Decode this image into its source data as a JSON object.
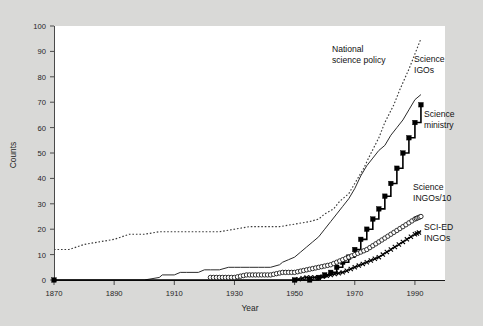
{
  "figure": {
    "background_color": "#d9d9d7",
    "plot_background_color": "#ffffff"
  },
  "axes": {
    "y_label": "Counts",
    "x_label": "Year",
    "y_ticks": [
      "0",
      "10",
      "20",
      "30",
      "40",
      "50",
      "60",
      "70",
      "80",
      "90",
      "100"
    ],
    "x_ticks": [
      "1870",
      "1890",
      "1910",
      "1930",
      "1950",
      "1970",
      "1990"
    ]
  },
  "annotations": {
    "national_science_policy": "National\nscience policy",
    "science_igos": "Science\nIGOs",
    "science_ministry": "Science\nministry",
    "science_ingos": "Science\nINGOs/10",
    "sci_ed_ingos": "SCI-ED\nINGOs"
  },
  "chart_data": {
    "type": "line",
    "title": "",
    "xlabel": "Year",
    "ylabel": "Counts",
    "xlim": [
      1870,
      2000
    ],
    "ylim": [
      0,
      100
    ],
    "xticks": [
      1870,
      1890,
      1910,
      1930,
      1950,
      1970,
      1990
    ],
    "yticks": [
      0,
      10,
      20,
      30,
      40,
      50,
      60,
      70,
      80,
      90,
      100
    ],
    "grid": false,
    "legend": "inline annotations",
    "series": [
      {
        "name": "National science policy",
        "style": "dotted",
        "marker": "none",
        "color": "#3a3a3a",
        "x": [
          1870,
          1875,
          1880,
          1885,
          1890,
          1895,
          1900,
          1905,
          1910,
          1915,
          1920,
          1925,
          1930,
          1935,
          1940,
          1945,
          1950,
          1955,
          1958,
          1960,
          1963,
          1965,
          1968,
          1970,
          1973,
          1975,
          1978,
          1980,
          1983,
          1985,
          1988,
          1990,
          1992
        ],
        "y": [
          12,
          12,
          14,
          15,
          16,
          18,
          18,
          19,
          19,
          19,
          19,
          19,
          20,
          21,
          21,
          21,
          22,
          23,
          24,
          26,
          28,
          31,
          34,
          38,
          44,
          49,
          56,
          62,
          69,
          75,
          83,
          89,
          95
        ]
      },
      {
        "name": "Science IGOs",
        "style": "solid-thin",
        "marker": "none",
        "color": "#2b2b2b",
        "x": [
          1870,
          1900,
          1905,
          1906,
          1910,
          1912,
          1914,
          1918,
          1920,
          1922,
          1925,
          1928,
          1930,
          1932,
          1935,
          1938,
          1940,
          1942,
          1945,
          1946,
          1948,
          1950,
          1952,
          1954,
          1956,
          1958,
          1960,
          1962,
          1964,
          1966,
          1968,
          1970,
          1972,
          1974,
          1976,
          1978,
          1980,
          1982,
          1984,
          1986,
          1988,
          1990,
          1992
        ],
        "y": [
          0,
          0,
          1,
          2,
          2,
          3,
          3,
          3,
          4,
          4,
          4,
          5,
          5,
          5,
          5,
          5,
          5,
          5,
          6,
          7,
          8,
          9,
          11,
          13,
          15,
          17,
          20,
          23,
          26,
          29,
          32,
          36,
          41,
          45,
          48,
          51,
          53,
          57,
          60,
          63,
          67,
          71,
          73
        ]
      },
      {
        "name": "Science ministry",
        "style": "step",
        "marker": "square",
        "color": "#000000",
        "x": [
          1870,
          1950,
          1955,
          1958,
          1960,
          1962,
          1964,
          1966,
          1968,
          1970,
          1972,
          1974,
          1976,
          1978,
          1980,
          1982,
          1984,
          1986,
          1988,
          1990,
          1992
        ],
        "y": [
          0,
          0,
          0,
          1,
          2,
          3,
          5,
          7,
          9,
          12,
          16,
          20,
          24,
          28,
          33,
          38,
          44,
          50,
          56,
          62,
          69
        ]
      },
      {
        "name": "Science INGOs/10",
        "style": "solid",
        "marker": "circle",
        "color": "#1a1a1a",
        "x": [
          1922,
          1926,
          1930,
          1934,
          1938,
          1942,
          1946,
          1950,
          1954,
          1958,
          1962,
          1966,
          1970,
          1974,
          1978,
          1982,
          1986,
          1990,
          1992
        ],
        "y": [
          1,
          1,
          1,
          2,
          2,
          2,
          3,
          3,
          4,
          5,
          6,
          8,
          10,
          12,
          15,
          18,
          21,
          24,
          25
        ]
      },
      {
        "name": "SCI-ED INGOs",
        "style": "solid",
        "marker": "x",
        "color": "#000000",
        "x": [
          1950,
          1954,
          1958,
          1962,
          1966,
          1970,
          1974,
          1978,
          1982,
          1986,
          1990,
          1992
        ],
        "y": [
          0,
          1,
          1,
          2,
          3,
          5,
          7,
          9,
          12,
          15,
          18,
          19
        ]
      }
    ]
  }
}
